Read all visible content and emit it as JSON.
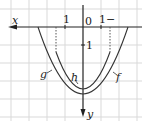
{
  "diagram": {
    "x_axis_label": "x",
    "y_axis_label": "y",
    "origin_label": "0",
    "tick_labels": {
      "x_positive_side": "1",
      "x_negative_side": "1−",
      "y_unit": "1"
    },
    "curve_labels": {
      "outer_left": "g",
      "inner": "h",
      "outer_right": "f"
    },
    "colors": {
      "grid": "#d9d9d9",
      "axis": "#222222",
      "curve": "#333333"
    }
  }
}
